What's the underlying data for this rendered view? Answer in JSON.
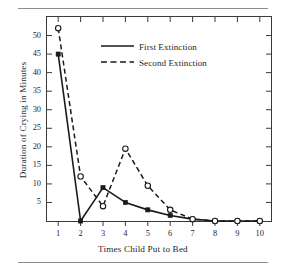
{
  "chart_data": {
    "type": "line",
    "title": "",
    "subtitle": "",
    "xlabel": "Times Child Put to Bed",
    "ylabel": "Duration of Crying in Minutes",
    "x": [
      1,
      2,
      3,
      4,
      5,
      6,
      7,
      8,
      9,
      10
    ],
    "xtick_labels": [
      "1",
      "2",
      "3",
      "4",
      "5",
      "6",
      "7",
      "8",
      "9",
      "10"
    ],
    "ytick_labels": [
      "5",
      "10",
      "15",
      "20",
      "25",
      "30",
      "35",
      "40",
      "45",
      "50"
    ],
    "ytick_values": [
      5,
      10,
      15,
      20,
      25,
      30,
      35,
      40,
      45,
      50
    ],
    "xlim": [
      0.5,
      10.5
    ],
    "ylim": [
      0,
      55
    ],
    "grid": false,
    "legend_position": "upper-center",
    "series": [
      {
        "name": "First Extinction",
        "line_style": "solid",
        "marker": "filled-square",
        "color": "#1a1a1a",
        "values": [
          45,
          0,
          9,
          5,
          3,
          1.5,
          0.5,
          0,
          0,
          0
        ]
      },
      {
        "name": "Second Extinction",
        "line_style": "dashed",
        "marker": "open-circle",
        "color": "#1a1a1a",
        "values": [
          52,
          12,
          4,
          19.5,
          9.5,
          3,
          0.5,
          0,
          0,
          0
        ]
      }
    ]
  },
  "legend": {
    "entries": [
      {
        "label": "First Extinction",
        "style": "solid"
      },
      {
        "label": "Second Extinction",
        "style": "dashed"
      }
    ]
  },
  "axes": {
    "x_title": "Times Child Put to Bed",
    "y_title": "Duration of Crying in Minutes"
  }
}
